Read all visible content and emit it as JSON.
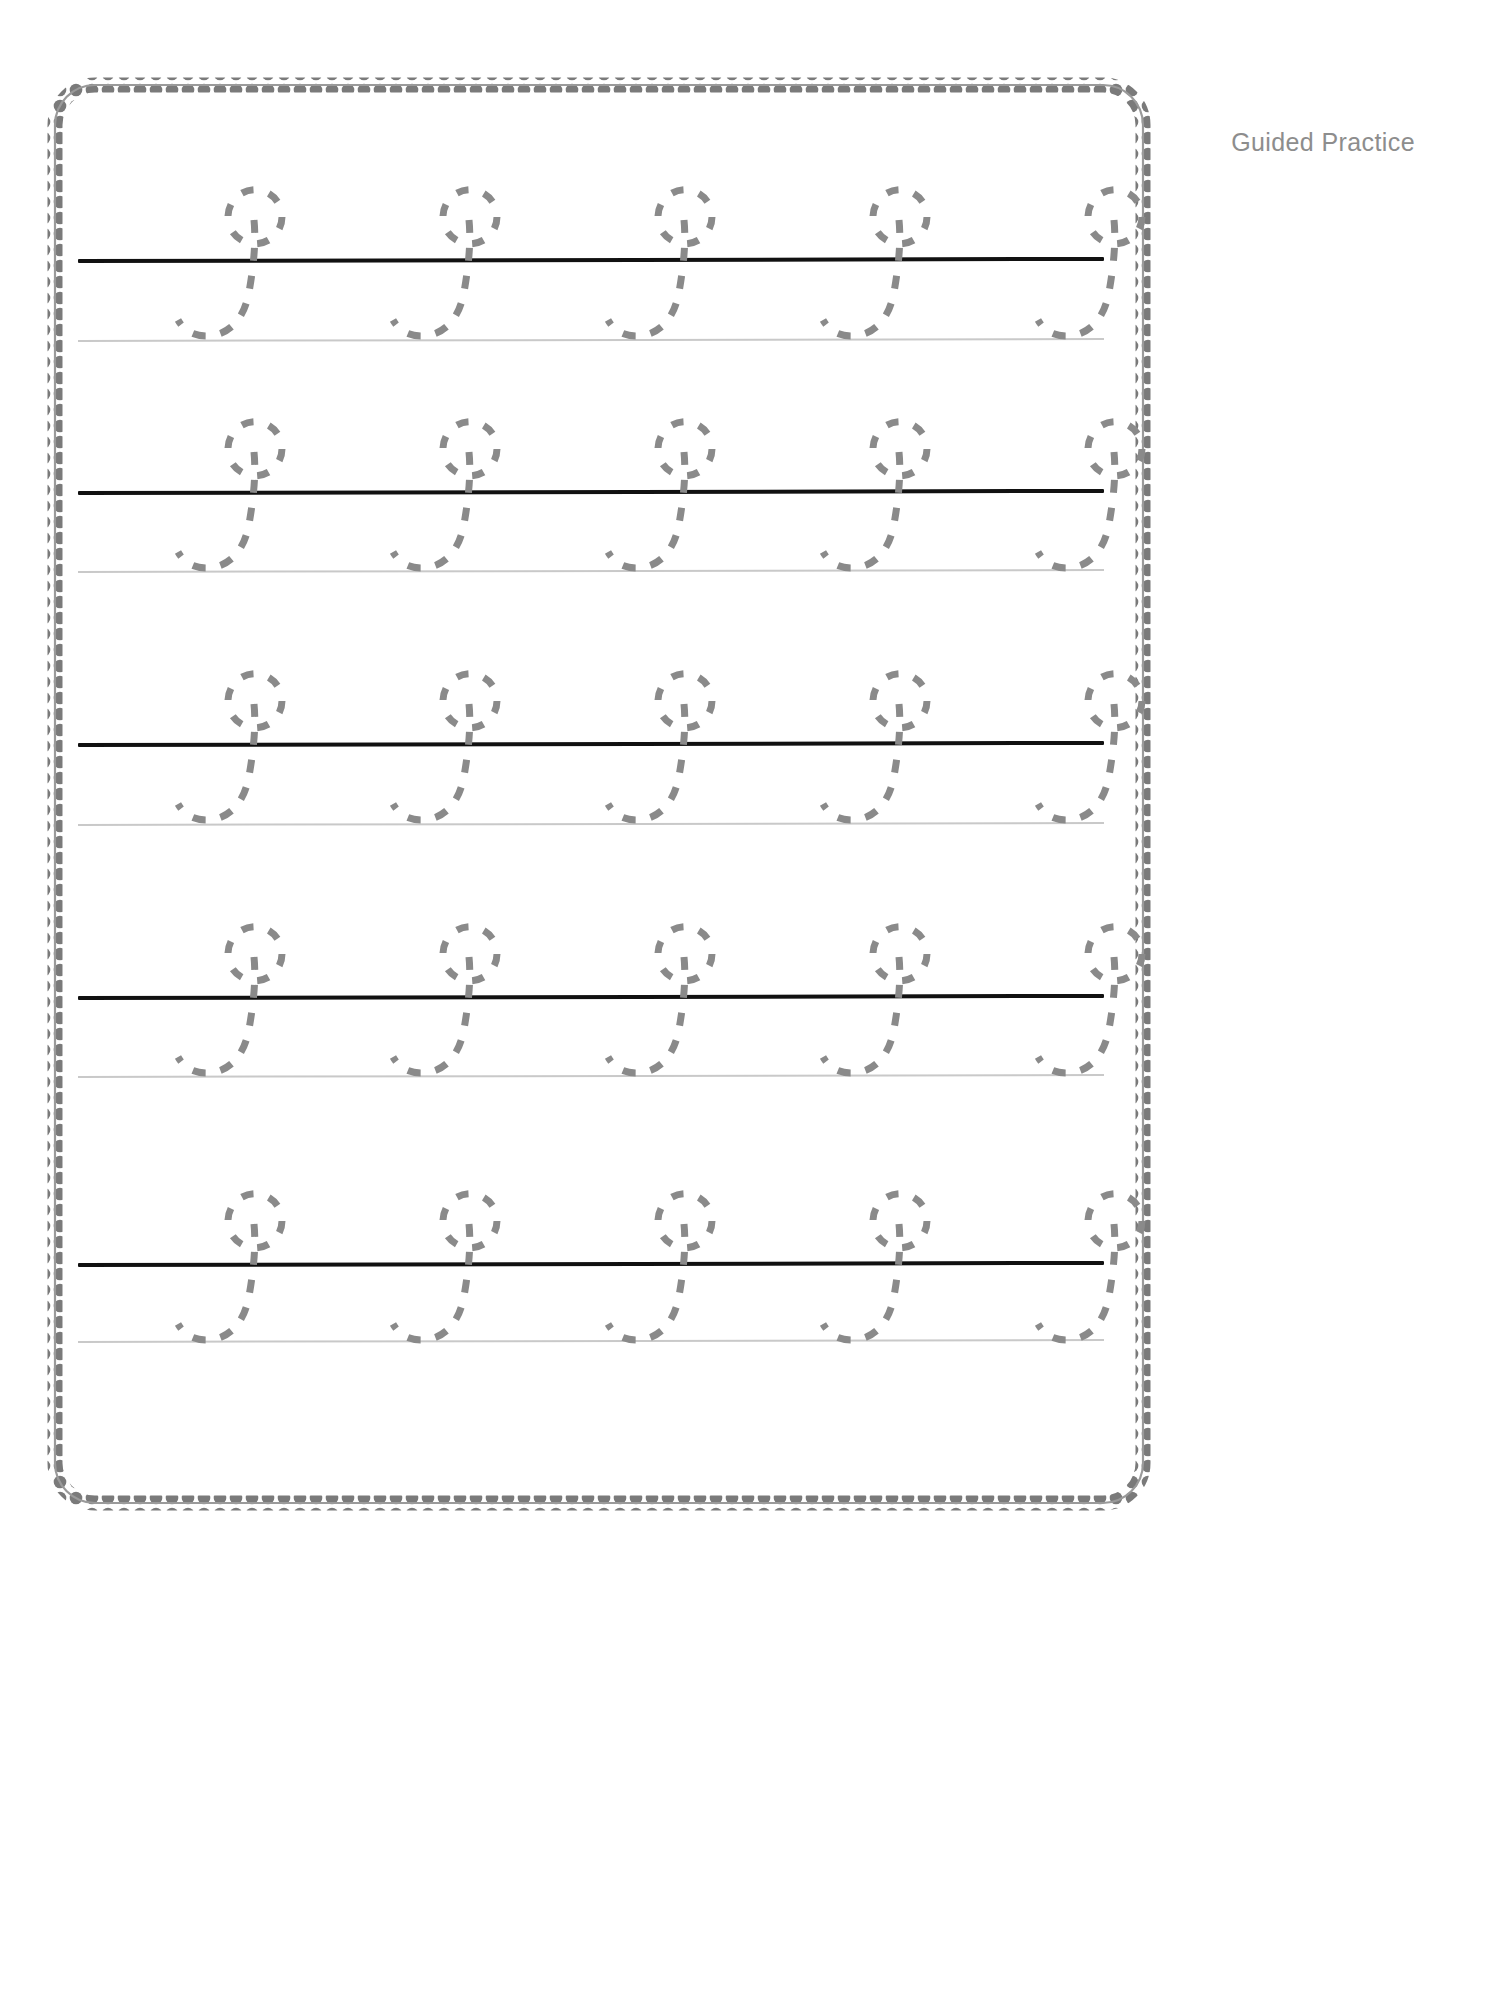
{
  "page": {
    "width": 1497,
    "height": 1993,
    "background_color": "#ffffff"
  },
  "header": {
    "label": "Guided Practice",
    "color": "#8d8d8d"
  },
  "border": {
    "name": "scalloped-decorative-border",
    "color": "#7a7a7a",
    "style": "scalloped-rounded-rectangle"
  },
  "worksheet": {
    "letter": "j",
    "letter_case": "lowercase",
    "style": "dashed-trace",
    "trace_color": "#8a8a8a",
    "baseline_color": "#111111",
    "guideline_color": "#c9c9c9",
    "rows_count": 5,
    "letters_per_row": 5,
    "rows": [
      {
        "index": 1,
        "name": "practice-row-1",
        "baseline_y": 258,
        "guideline_y": 339,
        "letters": [
          "j",
          "j",
          "j",
          "j",
          "j"
        ]
      },
      {
        "index": 2,
        "name": "practice-row-2",
        "baseline_y": 490,
        "guideline_y": 570,
        "letters": [
          "j",
          "j",
          "j",
          "j",
          "j"
        ]
      },
      {
        "index": 3,
        "name": "practice-row-3",
        "baseline_y": 742,
        "guideline_y": 823,
        "letters": [
          "j",
          "j",
          "j",
          "j",
          "j"
        ]
      },
      {
        "index": 4,
        "name": "practice-row-4",
        "baseline_y": 995,
        "guideline_y": 1075,
        "letters": [
          "j",
          "j",
          "j",
          "j",
          "j"
        ]
      },
      {
        "index": 5,
        "name": "practice-row-5",
        "baseline_y": 1262,
        "guideline_y": 1340,
        "letters": [
          "j",
          "j",
          "j",
          "j",
          "j"
        ]
      }
    ],
    "letter_x_positions": [
      150,
      365,
      580,
      795,
      1010
    ]
  }
}
